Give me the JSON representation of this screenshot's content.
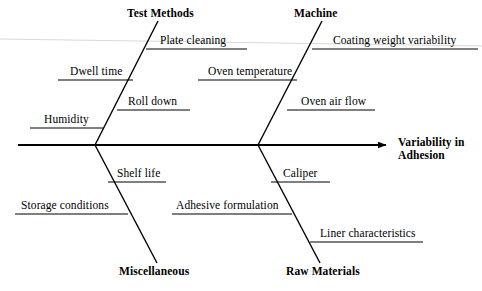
{
  "diagram": {
    "type": "fishbone-ishikawa",
    "effect": {
      "line1": "Variability in",
      "line2": "Adhesion"
    },
    "categories": [
      {
        "name": "Test Methods",
        "position": "upper-left",
        "causes": [
          "Plate cleaning",
          "Dwell time",
          "Roll down",
          "Humidity"
        ]
      },
      {
        "name": "Machine",
        "position": "upper-right",
        "causes": [
          "Coating weight variability",
          "Oven temperature",
          "Oven air flow"
        ]
      },
      {
        "name": "Miscellaneous",
        "position": "lower-left",
        "causes": [
          "Shelf life",
          "Storage conditions"
        ]
      },
      {
        "name": "Raw Materials",
        "position": "lower-right",
        "causes": [
          "Caliper",
          "Adhesive formulation",
          "Liner characteristics"
        ]
      }
    ],
    "labels": {
      "test_methods": "Test Methods",
      "machine": "Machine",
      "miscellaneous": "Miscellaneous",
      "raw_materials": "Raw Materials",
      "plate_cleaning": "Plate cleaning",
      "dwell_time": "Dwell time",
      "roll_down": "Roll down",
      "humidity": "Humidity",
      "coating_weight_variability": "Coating weight variability",
      "oven_temperature": "Oven temperature",
      "oven_air_flow": "Oven air flow",
      "shelf_life": "Shelf life",
      "storage_conditions": "Storage conditions",
      "caliper": "Caliper",
      "adhesive_formulation": "Adhesive formulation",
      "liner_characteristics": "Liner characteristics"
    },
    "colors": {
      "line": "#000000",
      "text": "#000000",
      "background": "#ffffff"
    }
  }
}
